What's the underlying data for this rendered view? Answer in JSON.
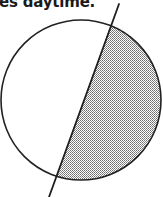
{
  "caption": {
    "text": "es daytime."
  },
  "diagram": {
    "circle": {
      "cx": 81,
      "cy": 100,
      "r": 80
    },
    "axis_line": {
      "x1": 119,
      "y1": 4,
      "x2": 49,
      "y2": 197
    },
    "chord": {
      "top": {
        "x": 111,
        "y": 25
      },
      "bottom": {
        "x": 55,
        "y": 180
      }
    },
    "colors": {
      "stroke": "#222222",
      "shade_dot": "#7a7a7a",
      "background": "#ffffff"
    },
    "regions": [
      {
        "name": "lit-side",
        "fill": "white"
      },
      {
        "name": "dark-side",
        "fill": "halftone-gray"
      }
    ]
  }
}
